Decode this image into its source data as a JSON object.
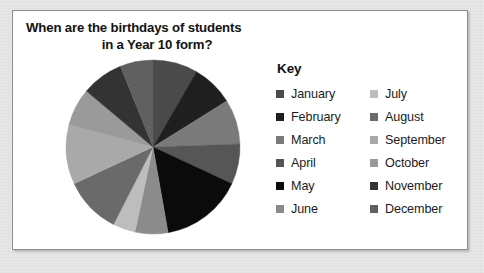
{
  "card": {
    "title_line_1": "When are the birthdays of students",
    "title_line_2": "in a Year 10 form?"
  },
  "legend": {
    "heading": "Key",
    "left_column": [
      {
        "label": "January",
        "color": "#4a4a4a"
      },
      {
        "label": "February",
        "color": "#1f1f1f"
      },
      {
        "label": "March",
        "color": "#7a7a7a"
      },
      {
        "label": "April",
        "color": "#565656"
      },
      {
        "label": "May",
        "color": "#0b0b0b"
      },
      {
        "label": "June",
        "color": "#8b8b8b"
      }
    ],
    "right_column": [
      {
        "label": "July",
        "color": "#bdbdbd"
      },
      {
        "label": "August",
        "color": "#6a6a6a"
      },
      {
        "label": "September",
        "color": "#a9a9a9"
      },
      {
        "label": "October",
        "color": "#9a9a9a"
      },
      {
        "label": "November",
        "color": "#333333"
      },
      {
        "label": "December",
        "color": "#606060"
      }
    ]
  },
  "chart_data": {
    "type": "pie",
    "title": "When are the birthdays of students in a Year 10 form?",
    "legend_position": "right",
    "start_angle_deg": 0,
    "direction": "clockwise",
    "categories": [
      "January",
      "February",
      "March",
      "April",
      "May",
      "June",
      "July",
      "August",
      "September",
      "October",
      "November",
      "December"
    ],
    "values": [
      30,
      28,
      30,
      27,
      55,
      22,
      15,
      38,
      40,
      25,
      28,
      22
    ],
    "value_unit": "degrees",
    "slices": [
      {
        "label": "January",
        "angle_deg": 30,
        "color": "#4a4a4a"
      },
      {
        "label": "February",
        "angle_deg": 28,
        "color": "#1f1f1f"
      },
      {
        "label": "March",
        "angle_deg": 30,
        "color": "#7a7a7a"
      },
      {
        "label": "April",
        "angle_deg": 27,
        "color": "#565656"
      },
      {
        "label": "May",
        "angle_deg": 55,
        "color": "#0b0b0b"
      },
      {
        "label": "June",
        "angle_deg": 22,
        "color": "#8b8b8b"
      },
      {
        "label": "July",
        "angle_deg": 15,
        "color": "#bdbdbd"
      },
      {
        "label": "August",
        "angle_deg": 38,
        "color": "#6a6a6a"
      },
      {
        "label": "September",
        "angle_deg": 40,
        "color": "#a9a9a9"
      },
      {
        "label": "October",
        "angle_deg": 25,
        "color": "#9a9a9a"
      },
      {
        "label": "November",
        "angle_deg": 28,
        "color": "#333333"
      },
      {
        "label": "December",
        "angle_deg": 22,
        "color": "#606060"
      }
    ]
  }
}
